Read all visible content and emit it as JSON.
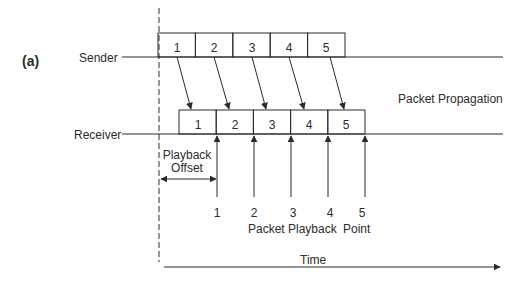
{
  "figure": {
    "panel_label": "(a)",
    "sender_label": "Sender",
    "receiver_label": "Receiver",
    "propagation_label": "Packet Propagation",
    "offset_label_line1": "Playback",
    "offset_label_line2": "Offset",
    "playback_label_a": "Packet Playback",
    "playback_label_b": "Point",
    "time_label": "Time",
    "sender_packets": [
      "1",
      "2",
      "3",
      "4",
      "5"
    ],
    "receiver_packets": [
      "1",
      "2",
      "3",
      "4",
      "5"
    ],
    "playback_points": [
      "1",
      "2",
      "3",
      "4",
      "5"
    ],
    "colors": {
      "stroke": "#2b2b2b",
      "background": "#ffffff"
    }
  }
}
